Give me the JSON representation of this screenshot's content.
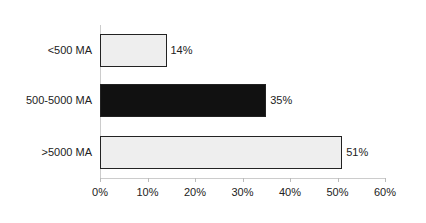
{
  "chart_data": {
    "type": "bar",
    "orientation": "horizontal",
    "title": "",
    "xlabel": "",
    "ylabel": "",
    "categories": [
      "<500 MA",
      "500-5000 MA",
      ">5000 MA"
    ],
    "values": [
      14,
      35,
      51
    ],
    "value_labels": [
      "14%",
      "35%",
      "51%"
    ],
    "bar_colors": [
      "#eeeeee",
      "#111111",
      "#eeeeee"
    ],
    "xlim": [
      0,
      60
    ],
    "xticks": [
      "0%",
      "10%",
      "20%",
      "30%",
      "40%",
      "50%",
      "60%"
    ],
    "grid": false,
    "legend": null
  }
}
